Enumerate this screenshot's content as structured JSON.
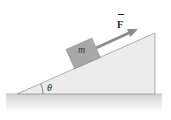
{
  "diagram": {
    "type": "inclined-plane-free-body",
    "block_label": "m",
    "force_label": "F",
    "force_vector_arrow": "⃗",
    "angle_label": "θ",
    "colors": {
      "incline_fill": "#e9e9e9",
      "incline_edge": "#9a9a9a",
      "ground_fill": "#d9d9d9",
      "block_fill": "#a8a8a8",
      "block_edge": "#8a8a8a",
      "arrow": "#8c8c8c",
      "text": "#222222"
    }
  }
}
